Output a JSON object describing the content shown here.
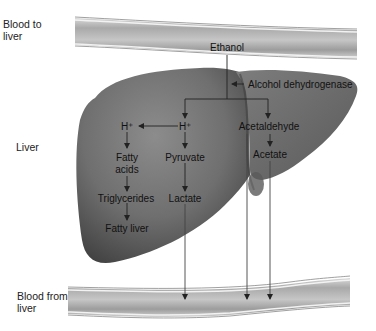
{
  "diagram": {
    "side_labels": {
      "blood_to_liver": [
        "Blood to",
        "liver"
      ],
      "liver": "Liver",
      "blood_from_liver": [
        "Blood from",
        "liver"
      ]
    },
    "nodes": {
      "ethanol": "Ethanol",
      "enzyme": "Alcohol dehydrogenase",
      "h_left": "H⁺",
      "h_center": "H⁺",
      "acetaldehyde": "Acetaldehyde",
      "fatty_acids": [
        "Fatty",
        "acids"
      ],
      "pyruvate": "Pyruvate",
      "acetate": "Acetate",
      "triglycerides": "Triglycerides",
      "lactate": "Lactate",
      "fatty_liver": "Fatty liver"
    },
    "edges": [
      {
        "from": "Blood to liver",
        "to": "Ethanol"
      },
      {
        "from": "Ethanol",
        "to": "H+ (center)",
        "via": "Alcohol dehydrogenase"
      },
      {
        "from": "Ethanol",
        "to": "Acetaldehyde",
        "via": "Alcohol dehydrogenase"
      },
      {
        "from": "H+ (center)",
        "to": "H+ (left)"
      },
      {
        "from": "H+ (left)",
        "to": "Fatty acids"
      },
      {
        "from": "Fatty acids",
        "to": "Triglycerides"
      },
      {
        "from": "Triglycerides",
        "to": "Fatty liver"
      },
      {
        "from": "H+ (center)",
        "to": "Pyruvate"
      },
      {
        "from": "Pyruvate",
        "to": "Lactate"
      },
      {
        "from": "Lactate",
        "to": "Blood from liver"
      },
      {
        "from": "Acetaldehyde",
        "to": "Acetate"
      },
      {
        "from": "Acetaldehyde",
        "to": "Blood from liver"
      },
      {
        "from": "Acetate",
        "to": "Blood from liver"
      }
    ],
    "colors": {
      "liver_dark": "#4a4a4a",
      "liver_light": "#8a8a8a",
      "vessel_mid": "#b8b8b8",
      "vessel_edge": "#e8e8e8",
      "arrow": "#222222"
    }
  }
}
